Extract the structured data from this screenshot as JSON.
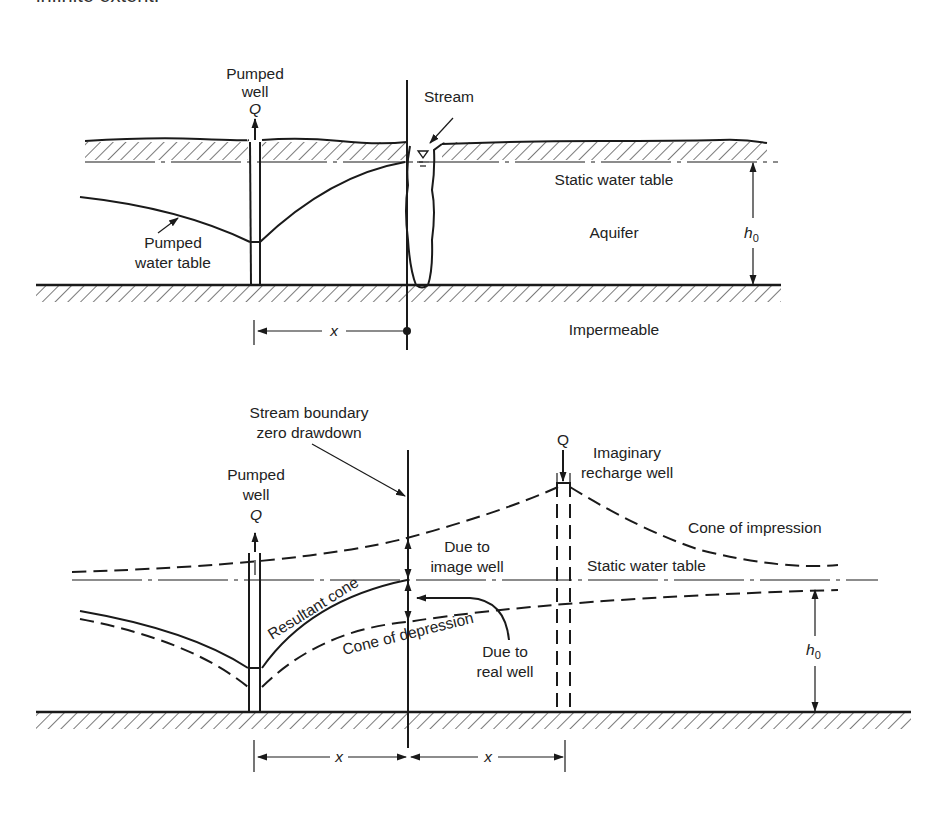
{
  "header": {
    "clipped_caption": "infinite extent."
  },
  "top_diagram": {
    "pumped_well_label_line1": "Pumped",
    "pumped_well_label_line2": "well",
    "discharge_symbol": "Q",
    "stream_label": "Stream",
    "static_water_table_label": "Static water table",
    "aquifer_label": "Aquifer",
    "thickness_symbol": "h",
    "thickness_subscript": "0",
    "pumped_water_table_line1": "Pumped",
    "pumped_water_table_line2": "water table",
    "impermeable_label": "Impermeable",
    "distance_symbol": "x"
  },
  "bottom_diagram": {
    "stream_boundary_line1": "Stream boundary",
    "stream_boundary_line2": "zero drawdown",
    "pumped_well_label_line1": "Pumped",
    "pumped_well_label_line2": "well",
    "pumped_discharge_symbol": "Q",
    "image_discharge_symbol": "Q",
    "image_well_line1": "Imaginary",
    "image_well_line2": "recharge well",
    "cone_of_impression_label": "Cone of impression",
    "due_to_image_line1": "Due to",
    "due_to_image_line2": "image well",
    "static_water_table_label": "Static water table",
    "resultant_cone_label": "Resultant cone",
    "cone_of_depression_label": "Cone of depression",
    "due_to_real_line1": "Due to",
    "due_to_real_line2": "real well",
    "thickness_symbol": "h",
    "thickness_subscript": "0",
    "distance_left_symbol": "x",
    "distance_right_symbol": "x"
  }
}
